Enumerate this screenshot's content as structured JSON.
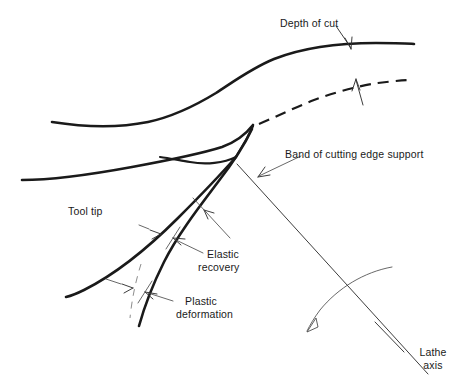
{
  "figure": {
    "type": "engineering-diagram",
    "background_color": "#ffffff",
    "line_color": "#1a1a1a",
    "leader_color": "#4d4d4d",
    "width": 464,
    "height": 388
  },
  "labels": {
    "depth_of_cut": "Depth of cut",
    "band_of_cutting_edge_support": "Band of cutting edge support",
    "tool_tip": "Tool tip",
    "elastic_recovery_line1": "Elastic",
    "elastic_recovery_line2": "recovery",
    "plastic_deformation_line1": "Plastic",
    "plastic_deformation_line2": "deformation",
    "lathe_axis_line1": "Lathe",
    "lathe_axis_line2": "axis"
  },
  "geometry": {
    "workpiece_uncut_surface": "M 52,122 C 100,129 150,128 196,112 C 232,100 246,84 272,70 C 310,50 360,44 414,44",
    "workpiece_cut_surface_dashed": "M 259,123 C 290,110 320,97 352,90 C 376,85 396,82 412,81",
    "tool_rake_face": "M 253,125 C 238,141 224,146 198,152 C 160,160 110,166 22,179",
    "tool_flank_upper": "M 253,126 C 247,140 240,150 236,156 C 222,172 196,196 168,223 C 140,250 110,276 68,294",
    "tool_wedge_lower": "M 236,156 C 224,170 208,188 196,204",
    "deformed_surface_curve": "M 252,128 C 243,148 228,170 208,194 C 186,220 162,258 147,292 C 142,304 139,316 137,326",
    "plastic_boundary_dashed": "M 138,268 C 133,282 130,298 129,318",
    "lathe_axis_line": "M 237,165 L 430,376",
    "lathe_axis_tick_1": "M 376,322 L 404,352",
    "rotation_arc": "M 306,332 C 330,300 358,278 392,268"
  },
  "leaders": {
    "depth_of_cut_arrow": {
      "from": "M 334,28 L 350,48",
      "tip": [
        350,
        49
      ]
    },
    "cut_surface_arrow": {
      "from": "M 362,104 L 356,80",
      "tip": [
        356,
        79
      ]
    },
    "band_support_arrow": {
      "from": "M 288,162 L 258,176",
      "tip": [
        257,
        177
      ]
    },
    "band_support_leader": "M 288,162 L 299,156",
    "elastic_recovery_leader": "M 202,257 L 175,241",
    "elastic_recovery_arrow_a": {
      "tip": [
        168,
        238
      ]
    },
    "elastic_recovery_arrow_b": {
      "tip": [
        152,
        232
      ]
    },
    "elastic_inner_leader": "M 228,223 L 198,207",
    "plastic_deformation_leader": "M 172,302 L 145,295",
    "plastic_arrow_a": {
      "tip": [
        139,
        294
      ]
    },
    "plastic_arrow_b": {
      "tip": [
        122,
        289
      ]
    }
  },
  "text_positions": {
    "depth_of_cut": [
      280,
      24
    ],
    "band_of_cutting_edge_support": [
      286,
      158
    ],
    "tool_tip": [
      68,
      214
    ],
    "elastic_recovery": [
      207,
      257
    ],
    "plastic_deformation": [
      178,
      302
    ],
    "lathe_axis": [
      412,
      355
    ]
  }
}
